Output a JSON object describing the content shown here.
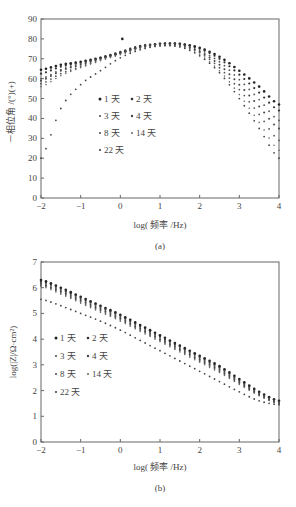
{
  "chart_data": [
    {
      "type": "scatter",
      "panel_label": "(a)",
      "title": "",
      "xlabel": "log( 频率 /Hz)",
      "ylabel": "－相位角 /(°)(+)",
      "xlim": [
        -2,
        4
      ],
      "ylim": [
        0,
        90
      ],
      "xticks": [
        -2,
        -1,
        0,
        1,
        2,
        3,
        4
      ],
      "yticks": [
        0,
        10,
        20,
        30,
        40,
        50,
        60,
        70,
        80,
        90
      ],
      "grid": false,
      "legend_position": "center-left",
      "legend": [
        "1 天",
        "2 天",
        "3 天",
        "4 天",
        "8 天",
        "14 天",
        "22 天"
      ],
      "sample_x": [
        -2,
        -1.5,
        -1,
        -0.5,
        0,
        0.5,
        1,
        1.5,
        2,
        2.5,
        3,
        3.5,
        4
      ],
      "series": [
        {
          "name": "1 天",
          "values": [
            64.5,
            67,
            68.5,
            70.5,
            73,
            76,
            77.5,
            77.5,
            75.5,
            71,
            64,
            56,
            47
          ]
        },
        {
          "name": "2 天",
          "values": [
            62.5,
            66,
            68,
            70.5,
            73.5,
            76.5,
            77.5,
            77.5,
            75,
            70,
            62,
            53,
            44
          ]
        },
        {
          "name": "3 天",
          "values": [
            60,
            64.5,
            67.5,
            70,
            73,
            76,
            77,
            77,
            74,
            68.5,
            59.5,
            49.5,
            39
          ]
        },
        {
          "name": "4 天",
          "values": [
            59,
            64,
            67,
            70,
            73,
            76,
            77.5,
            77,
            73.5,
            67,
            57,
            46,
            35
          ]
        },
        {
          "name": "8 天",
          "values": [
            57.5,
            62.5,
            66,
            69.5,
            72.5,
            75.5,
            77,
            76.5,
            73,
            65.5,
            54.5,
            42,
            29
          ]
        },
        {
          "name": "14 天",
          "values": [
            56,
            61.5,
            65.5,
            69,
            72,
            75,
            76.5,
            76,
            72,
            64,
            52,
            38,
            24
          ]
        },
        {
          "name": "22 天",
          "values": [
            20,
            45,
            57,
            64,
            70.5,
            74.5,
            76.5,
            76,
            71.5,
            63,
            50,
            35,
            20
          ]
        }
      ],
      "annotations": [
        {
          "x": 0.05,
          "y": 80,
          "note": "outlier point"
        }
      ]
    },
    {
      "type": "scatter",
      "panel_label": "(b)",
      "title": "",
      "xlabel": "log( 频率 /Hz)",
      "ylabel": "log(|Z|/Ω·cm²)",
      "xlim": [
        -2,
        4
      ],
      "ylim": [
        0,
        7
      ],
      "xticks": [
        -2,
        -1,
        0,
        1,
        2,
        3,
        4
      ],
      "yticks": [
        0,
        1,
        2,
        3,
        4,
        5,
        6,
        7
      ],
      "grid": false,
      "legend_position": "center-left",
      "legend": [
        "1 天",
        "2 天",
        "3 天",
        "4 天",
        "8 天",
        "14 天",
        "22 天"
      ],
      "sample_x": [
        -2,
        -1.5,
        -1,
        -0.5,
        0,
        0.5,
        1,
        1.5,
        2,
        2.5,
        3,
        3.5,
        4
      ],
      "series": [
        {
          "name": "1 天",
          "values": [
            6.3,
            6.0,
            5.65,
            5.3,
            4.95,
            4.55,
            4.15,
            3.75,
            3.35,
            2.95,
            2.45,
            1.95,
            1.6
          ]
        },
        {
          "name": "2 天",
          "values": [
            6.25,
            5.95,
            5.6,
            5.25,
            4.9,
            4.5,
            4.1,
            3.7,
            3.3,
            2.9,
            2.4,
            1.92,
            1.58
          ]
        },
        {
          "name": "3 天",
          "values": [
            6.2,
            5.9,
            5.55,
            5.2,
            4.85,
            4.45,
            4.05,
            3.65,
            3.25,
            2.85,
            2.36,
            1.88,
            1.55
          ]
        },
        {
          "name": "4 天",
          "values": [
            6.15,
            5.85,
            5.5,
            5.15,
            4.8,
            4.4,
            4.0,
            3.6,
            3.2,
            2.8,
            2.32,
            1.85,
            1.52
          ]
        },
        {
          "name": "8 天",
          "values": [
            6.1,
            5.8,
            5.45,
            5.1,
            4.75,
            4.35,
            3.95,
            3.55,
            3.15,
            2.75,
            2.28,
            1.82,
            1.5
          ]
        },
        {
          "name": "14 天",
          "values": [
            6.05,
            5.75,
            5.4,
            5.05,
            4.7,
            4.3,
            3.9,
            3.5,
            3.1,
            2.7,
            2.24,
            1.8,
            1.48
          ]
        },
        {
          "name": "22 天",
          "values": [
            5.55,
            5.3,
            5.0,
            4.7,
            4.35,
            3.95,
            3.55,
            3.15,
            2.75,
            2.35,
            1.95,
            1.6,
            1.45
          ]
        }
      ]
    }
  ]
}
